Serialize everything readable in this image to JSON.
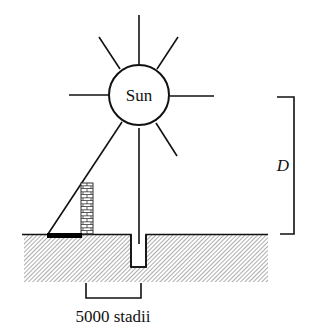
{
  "diagram": {
    "sun_label": "Sun",
    "distance_label": "D",
    "baseline_label": "5000 stadii",
    "colors": {
      "line": "#111111",
      "ground_hatch": "#9a9a9a",
      "background": "#ffffff",
      "shadow": "#000000"
    }
  }
}
